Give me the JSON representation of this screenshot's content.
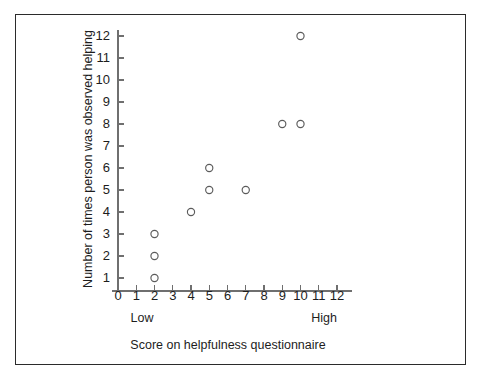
{
  "chart_data": {
    "type": "scatter",
    "title": "",
    "xlabel": "Score on helpfulness questionnaire",
    "ylabel": "Number of times person was observed helping",
    "xlim": [
      0,
      12
    ],
    "ylim": [
      0,
      12
    ],
    "grid": false,
    "legend": null,
    "x_tick_labels": [
      "0",
      "1",
      "2",
      "3",
      "4",
      "5",
      "6",
      "7",
      "8",
      "9",
      "10",
      "11",
      "12"
    ],
    "y_tick_labels": [
      "1",
      "2",
      "3",
      "4",
      "5",
      "6",
      "7",
      "8",
      "9",
      "10",
      "11",
      "12"
    ],
    "x_axis_end_annotations": {
      "low": "Low",
      "high": "High"
    },
    "marker_style": "open-circle",
    "marker_color": "#5b5b5b",
    "points": [
      {
        "x": 2,
        "y": 1
      },
      {
        "x": 2,
        "y": 2
      },
      {
        "x": 2,
        "y": 3
      },
      {
        "x": 4,
        "y": 4
      },
      {
        "x": 5,
        "y": 5
      },
      {
        "x": 5,
        "y": 6
      },
      {
        "x": 7,
        "y": 5
      },
      {
        "x": 9,
        "y": 8
      },
      {
        "x": 10,
        "y": 8
      },
      {
        "x": 10,
        "y": 12
      }
    ]
  },
  "figure": {
    "border_color": "#2b2b2b",
    "background_color": "#ffffff"
  }
}
